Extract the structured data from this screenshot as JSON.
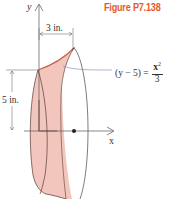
{
  "figure": {
    "title": "Figure P7.138",
    "title_color": "#e2592c",
    "axes": {
      "y_label": "y",
      "x_label": "x"
    },
    "dimensions": {
      "width_label": "3 in.",
      "height_label": "5 in."
    },
    "equation": {
      "lhs": "(y − 5) =",
      "numerator": "x",
      "exponent": "2",
      "denominator": "3"
    },
    "colors": {
      "surface_fill": "#f2c6bd",
      "surface_outline": "#5a3a35",
      "axis_line": "#555555",
      "leader_line": "#8c8fc4"
    }
  }
}
